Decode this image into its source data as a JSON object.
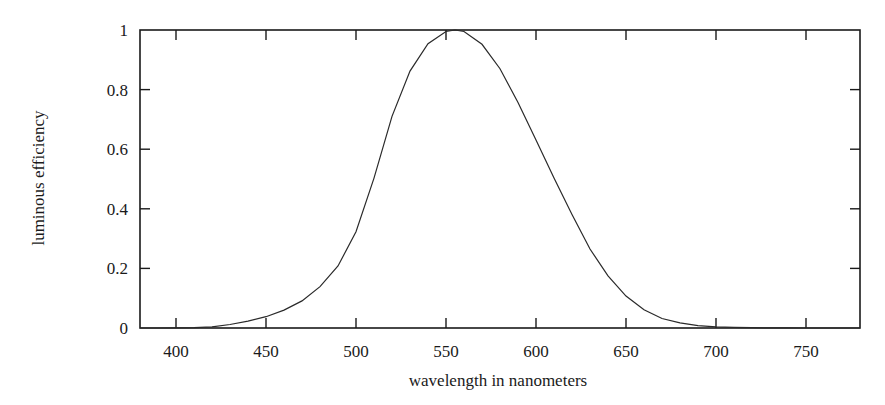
{
  "chart_data": {
    "type": "line",
    "title": "",
    "xlabel": "wavelength in nanometers",
    "ylabel": "luminous efficiency",
    "xlim": [
      380,
      780
    ],
    "ylim": [
      0,
      1
    ],
    "grid": false,
    "legend": null,
    "x_ticks": [
      400,
      450,
      500,
      550,
      600,
      650,
      700,
      750
    ],
    "x_tick_labels": [
      "400",
      "450",
      "500",
      "550",
      "600",
      "650",
      "700",
      "750"
    ],
    "y_ticks": [
      0,
      0.2,
      0.4,
      0.6,
      0.8,
      1
    ],
    "y_tick_labels": [
      "0",
      "0.2",
      "0.4",
      "0.6",
      "0.8",
      "1"
    ],
    "series": [
      {
        "name": "luminous efficiency",
        "x": [
          380,
          390,
          400,
          410,
          420,
          430,
          440,
          450,
          460,
          470,
          480,
          490,
          500,
          510,
          520,
          530,
          540,
          550,
          555,
          560,
          570,
          580,
          590,
          600,
          610,
          620,
          630,
          640,
          650,
          660,
          670,
          680,
          690,
          700,
          710,
          720,
          730,
          740,
          750,
          760,
          770,
          780
        ],
        "values": [
          0.0,
          0.0001,
          0.0004,
          0.0012,
          0.004,
          0.0116,
          0.023,
          0.038,
          0.06,
          0.091,
          0.139,
          0.208,
          0.323,
          0.503,
          0.71,
          0.862,
          0.954,
          0.995,
          1.0,
          0.995,
          0.952,
          0.87,
          0.757,
          0.631,
          0.503,
          0.381,
          0.265,
          0.175,
          0.107,
          0.061,
          0.032,
          0.017,
          0.0082,
          0.0041,
          0.0021,
          0.001,
          0.0005,
          0.0002,
          0.0001,
          0.0001,
          0.0,
          0.0
        ]
      }
    ]
  },
  "style": {
    "line_color": "#2a2a2a",
    "axis_color": "#1a1a1a",
    "background": "#ffffff"
  }
}
